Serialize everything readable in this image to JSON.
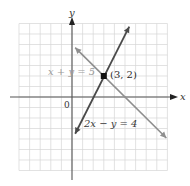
{
  "chart_data": {
    "type": "line",
    "title": "",
    "xlabel": "x",
    "ylabel": "y",
    "xlim": [
      -5,
      9
    ],
    "ylim": [
      -7,
      7
    ],
    "grid": true,
    "origin_label": "0",
    "series": [
      {
        "name": "x + y = 5",
        "equation": "x + y = 5",
        "color": "#8e8e8e",
        "x": [
          0.3,
          8.9
        ],
        "y": [
          4.7,
          -3.9
        ]
      },
      {
        "name": "2x − y = 4",
        "equation": "2x − y = 4",
        "color": "#4a4a4a",
        "x": [
          0.3,
          5.4
        ],
        "y": [
          -3.5,
          6.7
        ]
      }
    ],
    "annotations": [
      {
        "text": "(3, 2)",
        "x": 3,
        "y": 2,
        "type": "intersection-point"
      }
    ]
  },
  "labels": {
    "x_axis": "x",
    "y_axis": "y",
    "origin": "0",
    "line1": "x + y = 5",
    "line2": "2x − y = 4",
    "point": "(3, 2)"
  }
}
